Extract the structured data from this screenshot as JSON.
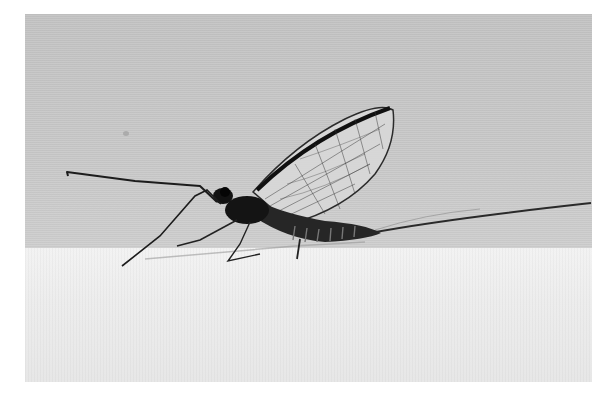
{
  "image": {
    "subject": "mayfly",
    "description": "Black-and-white photograph of a mayfly standing on a white surface against a light grey background, wings raised, long forelegs extended forward and two long tail filaments trailing behind",
    "palette": {
      "background": "#c9c9c9",
      "surface": "#ececec",
      "insect_body": "#1a1a1a",
      "wing_veins": "#2b2b2b",
      "page": "#ffffff"
    }
  }
}
